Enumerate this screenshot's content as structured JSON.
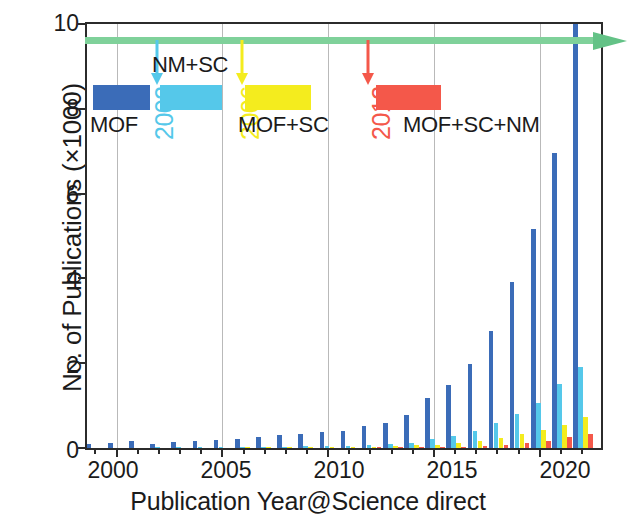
{
  "chart_data": {
    "type": "bar",
    "title": "",
    "subtitle": "",
    "xlabel": "Publication Year@Science direct",
    "ylabel": "No. of Publications (×1000)",
    "grid": "vertical gridlines at 2000, 2005, 2010, 2015, 2020",
    "legend_position": "inside-top-left",
    "xlim": [
      1998.6,
      2022.9
    ],
    "ylim": [
      0,
      10
    ],
    "yticks": [
      "0",
      "2",
      "4",
      "6",
      "8",
      "10"
    ],
    "ytick_values": [
      0,
      2,
      4,
      6,
      8,
      10
    ],
    "xticks": [
      "2000",
      "2005",
      "2010",
      "2015",
      "2020"
    ],
    "xtick_values": [
      2000,
      2005,
      2010,
      2015,
      2020
    ],
    "categories": [
      1999,
      2000,
      2001,
      2002,
      2003,
      2004,
      2005,
      2006,
      2007,
      2008,
      2009,
      2010,
      2011,
      2012,
      2013,
      2014,
      2015,
      2016,
      2017,
      2018,
      2019,
      2020,
      2021,
      2022
    ],
    "series": [
      {
        "name": "MOF",
        "color": "#3b6cb8",
        "values": [
          0.09,
          0.12,
          0.16,
          0.1,
          0.15,
          0.16,
          0.19,
          0.22,
          0.26,
          0.3,
          0.33,
          0.37,
          0.4,
          0.52,
          0.6,
          0.78,
          1.18,
          1.48,
          1.97,
          2.77,
          3.92,
          5.17,
          6.95,
          10.0
        ]
      },
      {
        "name": "NM+SC",
        "color": "#55c8ea",
        "values": [
          0.0,
          0.0,
          0.0,
          0.01,
          0.01,
          0.02,
          0.02,
          0.02,
          0.03,
          0.03,
          0.04,
          0.05,
          0.05,
          0.07,
          0.09,
          0.13,
          0.21,
          0.28,
          0.4,
          0.58,
          0.8,
          1.05,
          1.5,
          1.9
        ]
      },
      {
        "name": "MOF+SC",
        "color": "#f4ec1e",
        "values": [
          0.0,
          0.0,
          0.0,
          0.0,
          0.0,
          0.0,
          0.0,
          0.01,
          0.01,
          0.01,
          0.01,
          0.02,
          0.02,
          0.03,
          0.04,
          0.06,
          0.08,
          0.11,
          0.16,
          0.23,
          0.32,
          0.42,
          0.55,
          0.72
        ]
      },
      {
        "name": "MOF+SC+NM",
        "color": "#f4584a",
        "values": [
          0.0,
          0.0,
          0.0,
          0.0,
          0.0,
          0.0,
          0.0,
          0.0,
          0.0,
          0.0,
          0.0,
          0.0,
          0.0,
          0.01,
          0.01,
          0.01,
          0.02,
          0.03,
          0.05,
          0.08,
          0.12,
          0.17,
          0.25,
          0.33
        ]
      }
    ],
    "annotations": [
      {
        "label": "NM+SC",
        "year_marker": "2002",
        "at_year": 2002,
        "color": "#55c8ea"
      },
      {
        "label": "MOF+SC",
        "year_marker": "2006",
        "at_year": 2006,
        "color": "#f4ec1e"
      },
      {
        "label": "MOF+SC+NM",
        "year_marker": "2012",
        "at_year": 2012,
        "color": "#f4584a"
      }
    ],
    "trend_arrow": {
      "name": "green-trend-arrow",
      "color": "#7fd19a",
      "y_value": 9.55,
      "direction": "right"
    }
  },
  "legend": {
    "items": [
      {
        "label": "MOF",
        "color": "#3b6cb8",
        "year": ""
      },
      {
        "label": "NM+SC",
        "color": "#55c8ea",
        "year": "2002"
      },
      {
        "label": "MOF+SC",
        "color": "#f4ec1e",
        "year": "2006"
      },
      {
        "label": "MOF+SC+NM",
        "color": "#f4584a",
        "year": "2012"
      }
    ]
  },
  "axes": {
    "x_title": "Publication Year@Science direct",
    "y_title": "No. of Publications (×1000)",
    "y_ticks": [
      "10",
      "8",
      "6",
      "4",
      "2",
      "0"
    ],
    "x_ticks": [
      "2000",
      "2005",
      "2010",
      "2015",
      "2020"
    ]
  }
}
